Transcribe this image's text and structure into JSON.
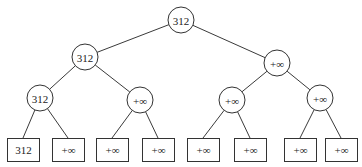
{
  "diagram": {
    "type": "tournament-tree",
    "nodes": [
      {
        "id": "root",
        "label": "312",
        "shape": "circle",
        "cx": 181,
        "cy": 20,
        "r": 13
      },
      {
        "id": "l2a",
        "label": "312",
        "shape": "circle",
        "cx": 85,
        "cy": 57,
        "r": 13
      },
      {
        "id": "l2b",
        "label": "+∞",
        "shape": "circle",
        "cx": 277,
        "cy": 63,
        "r": 13
      },
      {
        "id": "l3a",
        "label": "312",
        "shape": "circle",
        "cx": 40,
        "cy": 98,
        "r": 13
      },
      {
        "id": "l3b",
        "label": "+∞",
        "shape": "circle",
        "cx": 140,
        "cy": 100,
        "r": 13
      },
      {
        "id": "l3c",
        "label": "+∞",
        "shape": "circle",
        "cx": 232,
        "cy": 100,
        "r": 13
      },
      {
        "id": "l3d",
        "label": "+∞",
        "shape": "circle",
        "cx": 320,
        "cy": 98,
        "r": 13
      }
    ],
    "leaves": [
      {
        "id": "leaf1",
        "label": "312",
        "x": 7,
        "y": 138,
        "w": 32,
        "h": 23
      },
      {
        "id": "leaf2",
        "label": "+∞",
        "x": 52,
        "y": 138,
        "w": 32,
        "h": 23
      },
      {
        "id": "leaf3",
        "label": "+∞",
        "x": 96,
        "y": 138,
        "w": 32,
        "h": 23
      },
      {
        "id": "leaf4",
        "label": "+∞",
        "x": 142,
        "y": 138,
        "w": 32,
        "h": 23
      },
      {
        "id": "leaf5",
        "label": "+∞",
        "x": 187,
        "y": 138,
        "w": 32,
        "h": 23
      },
      {
        "id": "leaf6",
        "label": "+∞",
        "x": 234,
        "y": 138,
        "w": 32,
        "h": 23
      },
      {
        "id": "leaf7",
        "label": "+∞",
        "x": 284,
        "y": 138,
        "w": 32,
        "h": 23
      },
      {
        "id": "leaf8",
        "label": "+∞",
        "x": 325,
        "y": 138,
        "w": 32,
        "h": 23
      }
    ],
    "edges": [
      [
        "root",
        "l2a"
      ],
      [
        "root",
        "l2b"
      ],
      [
        "l2a",
        "l3a"
      ],
      [
        "l2a",
        "l3b"
      ],
      [
        "l2b",
        "l3c"
      ],
      [
        "l2b",
        "l3d"
      ],
      [
        "l3a",
        "leaf1"
      ],
      [
        "l3a",
        "leaf2"
      ],
      [
        "l3b",
        "leaf3"
      ],
      [
        "l3b",
        "leaf4"
      ],
      [
        "l3c",
        "leaf5"
      ],
      [
        "l3c",
        "leaf6"
      ],
      [
        "l3d",
        "leaf7"
      ],
      [
        "l3d",
        "leaf8"
      ]
    ]
  }
}
